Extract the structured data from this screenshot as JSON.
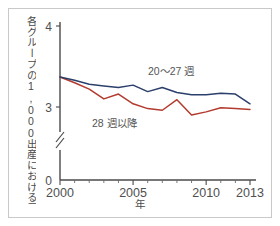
{
  "figure": {
    "ylabel": "各グループの1,000出産における周産期死亡数",
    "xlabel": "年"
  },
  "axis": {
    "y_ticks": [
      "4",
      "3",
      "0"
    ],
    "x_ticks": [
      "2000",
      "2005",
      "2010",
      "2013"
    ]
  },
  "legend": {
    "series_a": "20〜27 週",
    "series_b": "28 週以降"
  },
  "colors": {
    "series_a": "#2b3f6b",
    "series_b": "#b33a2e",
    "axis": "#4a4a4a",
    "frame": "#c9c9c9",
    "text": "#4f4f4f"
  },
  "chart_data": {
    "type": "line",
    "title": "",
    "xlabel": "年",
    "ylabel": "各グループの1,000出産における周産期死亡数",
    "x": [
      2000,
      2001,
      2002,
      2003,
      2004,
      2005,
      2006,
      2007,
      2008,
      2009,
      2010,
      2011,
      2012,
      2013
    ],
    "xlim": [
      2000,
      2013
    ],
    "ylim": [
      0,
      4
    ],
    "y_axis_break": true,
    "y_break_between": [
      0,
      3
    ],
    "grid": false,
    "legend_position": "inline-annotation",
    "series": [
      {
        "name": "20〜27 週",
        "color": "#2b3f6b",
        "values": [
          3.37,
          3.33,
          3.28,
          3.26,
          3.24,
          3.27,
          3.19,
          3.24,
          3.18,
          3.15,
          3.15,
          3.17,
          3.16,
          3.04
        ]
      },
      {
        "name": "28 週以降",
        "color": "#b33a2e",
        "values": [
          3.37,
          3.3,
          3.22,
          3.1,
          3.16,
          3.04,
          2.98,
          2.96,
          3.09,
          2.9,
          2.94,
          2.99,
          2.98,
          2.97
        ]
      }
    ]
  }
}
